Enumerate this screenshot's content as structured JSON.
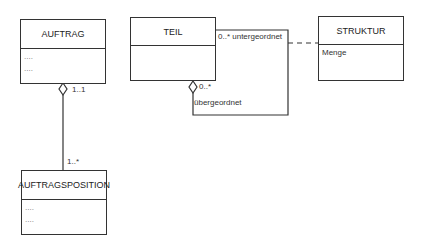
{
  "classes": {
    "auftrag": {
      "name": "AUFTRAG",
      "attributes": [
        "....",
        "...."
      ]
    },
    "teil": {
      "name": "TEIL",
      "attributes": []
    },
    "struktur": {
      "name": "STRUKTUR",
      "attributes": [
        "Menge"
      ]
    },
    "auftragsposition": {
      "name": "AUFTRAGSPOSITION",
      "attributes": [
        "....",
        "...."
      ]
    }
  },
  "associations": {
    "auftrag_position": {
      "source_multiplicity": "1..1",
      "target_multiplicity": "1..*",
      "type": "aggregation"
    },
    "teil_self": {
      "sub_label": "0..* untergeordnet",
      "super_multiplicity": "0..*",
      "super_role": "übergeordnet",
      "type": "aggregation"
    },
    "struktur_link": {
      "type": "association-class",
      "style": "dashed"
    }
  },
  "colors": {
    "line": "#333333",
    "background": "#ffffff"
  }
}
